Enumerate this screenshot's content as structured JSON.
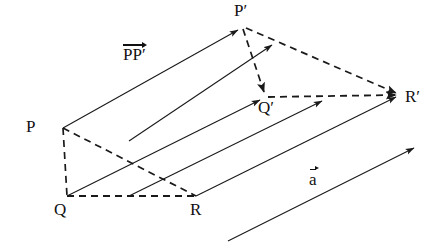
{
  "figure": {
    "kind": "geometry-translation-diagram",
    "background_color": "#ffffff",
    "stroke_color": "#1a1a1a",
    "solid_stroke_width": 1.1,
    "dashed_stroke_width": 1.6,
    "dash_pattern": "7,5"
  },
  "points": {
    "P": {
      "label": "P",
      "x": 63,
      "y": 128,
      "label_x": 26,
      "label_y": 118
    },
    "Q": {
      "label": "Q",
      "x": 67,
      "y": 196,
      "label_x": 54,
      "label_y": 203
    },
    "R": {
      "label": "R",
      "x": 196,
      "y": 196,
      "label_x": 191,
      "label_y": 203
    },
    "Pprime": {
      "label": "P′",
      "x": 243,
      "y": 27,
      "label_x": 236,
      "label_y": 2
    },
    "Qprime": {
      "label": "Q′",
      "x": 265,
      "y": 97,
      "label_x": 259,
      "label_y": 100
    },
    "Rprime": {
      "label": "R′",
      "x": 401,
      "y": 95,
      "label_x": 405,
      "label_y": 90
    }
  },
  "translation_arrows": [
    {
      "name": "P-to-Pprime",
      "x1": 63,
      "y1": 128,
      "x2": 243,
      "y2": 27
    },
    {
      "name": "Q-to-Qprime",
      "x1": 67,
      "y1": 196,
      "x2": 265,
      "y2": 97
    },
    {
      "name": "R-to-Rprime",
      "x1": 196,
      "y1": 196,
      "x2": 401,
      "y2": 95
    },
    {
      "name": "mid-upper-arrow",
      "x1": 129,
      "y1": 141,
      "x2": 277,
      "y2": 42
    },
    {
      "name": "mid-lower-arrow",
      "x1": 129,
      "y1": 196,
      "x2": 327,
      "y2": 99
    },
    {
      "name": "free-vector-a",
      "x1": 228,
      "y1": 241,
      "x2": 419,
      "y2": 146
    }
  ],
  "dashed_edges": [
    {
      "name": "edge-P-Q",
      "x1": 63,
      "y1": 128,
      "x2": 67,
      "y2": 196
    },
    {
      "name": "edge-Q-R",
      "x1": 67,
      "y1": 196,
      "x2": 196,
      "y2": 196
    },
    {
      "name": "edge-P-R",
      "x1": 63,
      "y1": 128,
      "x2": 196,
      "y2": 196
    },
    {
      "name": "edge-Pprime-Qprime",
      "x1": 243,
      "y1": 27,
      "x2": 265,
      "y2": 97
    },
    {
      "name": "edge-Qprime-Rprime",
      "x1": 265,
      "y1": 97,
      "x2": 401,
      "y2": 95
    },
    {
      "name": "edge-Pprime-Rprime",
      "x1": 243,
      "y1": 27,
      "x2": 401,
      "y2": 95
    }
  ],
  "labels": {
    "vector_pp_prime": {
      "text": "PP′",
      "x": 125,
      "y": 46
    },
    "vector_a": {
      "text": "a",
      "x": 310,
      "y": 172
    }
  }
}
